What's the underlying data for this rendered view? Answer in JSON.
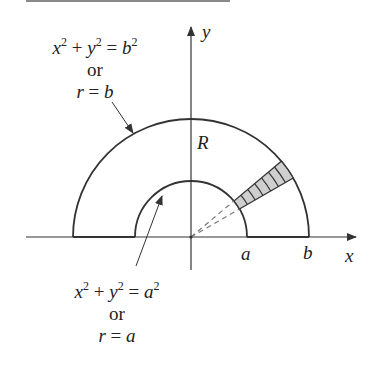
{
  "figure": {
    "outer_curve": {
      "equation": {
        "x": "x",
        "plus": "+",
        "y": "y",
        "eq": "=",
        "rhs": "b",
        "exp": "2"
      },
      "or": "or",
      "polar": {
        "lhs": "r",
        "eq": "=",
        "rhs": "b"
      }
    },
    "inner_curve": {
      "equation": {
        "x": "x",
        "plus": "+",
        "y": "y",
        "eq": "=",
        "rhs": "a",
        "exp": "2"
      },
      "or": "or",
      "polar": {
        "lhs": "r",
        "eq": "=",
        "rhs": "a"
      }
    },
    "region_label": "R",
    "axes": {
      "x_label": "x",
      "y_label": "y"
    },
    "tick_labels": {
      "a": "a",
      "b": "b"
    },
    "colors": {
      "stroke": "#333333",
      "shade": "#cfcfcf",
      "dashed": "#777777"
    }
  }
}
